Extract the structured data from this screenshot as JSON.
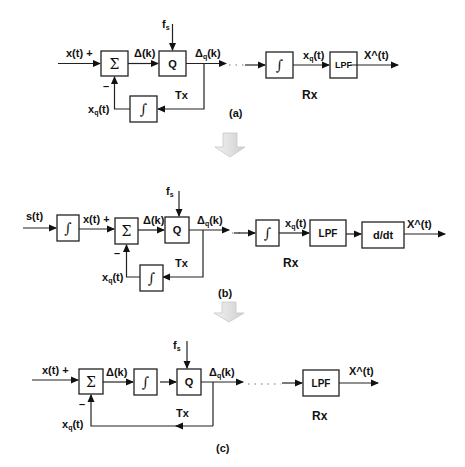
{
  "diagrams": [
    {
      "id": "a",
      "caption": "(a)",
      "tx_label": "Tx",
      "rx_label": "Rx",
      "input_label": "x(t) +",
      "minus_sign": "–",
      "feedback_label": "xq(t)",
      "feedback_label_main": "x",
      "feedback_label_sub": "q",
      "feedback_label_tail": "(t)",
      "sampling_label_main": "f",
      "sampling_label_sub": "s",
      "delta_label": "Δ(k)",
      "delta_q_main": "Δ",
      "delta_q_sub": "q",
      "delta_q_tail": "(k)",
      "rx_xq_main": "x",
      "rx_xq_sub": "q",
      "rx_xq_tail": "(t)",
      "output_label": "X^(t)",
      "blocks": {
        "sum": "Σ",
        "quantizer": "Q",
        "tx_integrator": "∫",
        "rx_integrator": "∫",
        "lpf": "LPF"
      }
    },
    {
      "id": "b",
      "caption": "(b)",
      "tx_label": "Tx",
      "rx_label": "Rx",
      "source_label": "s(t)",
      "input_label": "x(t) +",
      "minus_sign": "–",
      "feedback_label_main": "x",
      "feedback_label_sub": "q",
      "feedback_label_tail": "(t)",
      "sampling_label_main": "f",
      "sampling_label_sub": "s",
      "delta_label": "Δ(k)",
      "delta_q_main": "Δ",
      "delta_q_sub": "q",
      "delta_q_tail": "(k)",
      "rx_xq_main": "x",
      "rx_xq_sub": "q",
      "rx_xq_tail": "(t)",
      "output_label": "X^(t)",
      "blocks": {
        "pre_integrator": "∫",
        "sum": "Σ",
        "quantizer": "Q",
        "tx_integrator": "∫",
        "rx_integrator": "∫",
        "lpf": "LPF",
        "differentiator": "d/dt"
      }
    },
    {
      "id": "c",
      "caption": "(c)",
      "tx_label": "Tx",
      "rx_label": "Rx",
      "input_label": "x(t) +",
      "minus_sign": "–",
      "feedback_label_main": "x",
      "feedback_label_sub": "q",
      "feedback_label_tail": "(t)",
      "sampling_label_main": "f",
      "sampling_label_sub": "s",
      "delta_label": "Δ(k)",
      "delta_q_main": "Δ",
      "delta_q_sub": "q",
      "delta_q_tail": "(k)",
      "output_label": "X^(t)",
      "blocks": {
        "sum": "Σ",
        "integrator": "∫",
        "quantizer": "Q",
        "lpf": "LPF"
      }
    }
  ],
  "transition_arrows": [
    {
      "from": "a",
      "to": "b",
      "color": "#d9d9d9"
    },
    {
      "from": "b",
      "to": "c",
      "color": "#d9d9d9"
    }
  ]
}
